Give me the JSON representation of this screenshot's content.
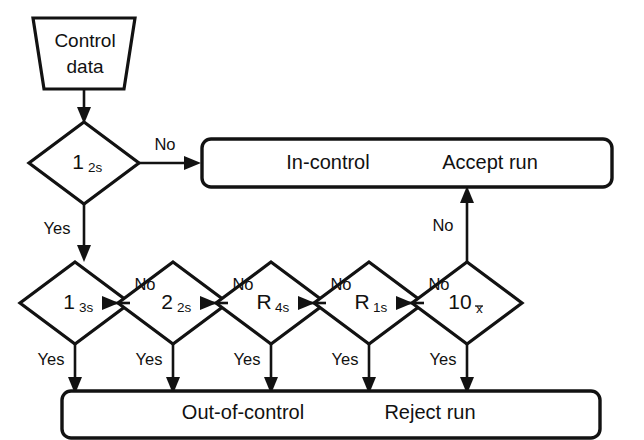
{
  "diagram": {
    "colors": {
      "stroke": "#121212",
      "fill": "#ffffff",
      "text": "#111111"
    },
    "source_node": {
      "shape": "trapezoid",
      "line1": "Control",
      "line2": "data"
    },
    "decisions": [
      {
        "id": "d_1_2s",
        "main": "1",
        "sub": "2s",
        "sub_overbar": false,
        "yes_label": "Yes",
        "no_label": "No"
      },
      {
        "id": "d_1_3s",
        "main": "1",
        "sub": "3s",
        "sub_overbar": false,
        "yes_label": "Yes",
        "no_label": "No"
      },
      {
        "id": "d_2_2s",
        "main": "2",
        "sub": "2s",
        "sub_overbar": false,
        "yes_label": "Yes",
        "no_label": "No"
      },
      {
        "id": "d_R_4s",
        "main": "R",
        "sub": "4s",
        "sub_overbar": false,
        "yes_label": "Yes",
        "no_label": "No"
      },
      {
        "id": "d_R_1s",
        "main": "R",
        "sub": "1s",
        "sub_overbar": false,
        "yes_label": "Yes",
        "no_label": "No"
      },
      {
        "id": "d_10_x",
        "main": "10",
        "sub": "x",
        "sub_overbar": true,
        "yes_label": "Yes",
        "no_label": "No"
      }
    ],
    "accept_box": {
      "left_text": "In-control",
      "right_text": "Accept run"
    },
    "reject_box": {
      "left_text": "Out-of-control",
      "right_text": "Reject run"
    },
    "edge_labels": {
      "first_no": "No",
      "first_yes": "Yes",
      "chain_no_1": "No",
      "chain_no_2": "No",
      "chain_no_3": "No",
      "chain_no_4": "No",
      "chain_no_5": "No",
      "yes_1": "Yes",
      "yes_2": "Yes",
      "yes_3": "Yes",
      "yes_4": "Yes",
      "yes_5": "Yes",
      "final_no": "No"
    }
  }
}
